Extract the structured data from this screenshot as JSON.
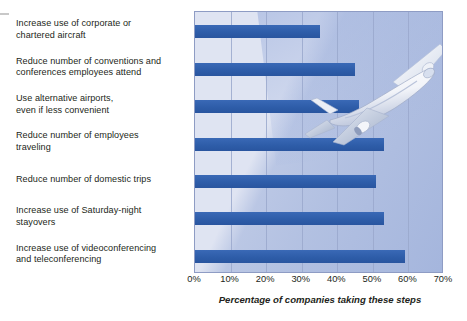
{
  "chart_data": {
    "type": "bar",
    "orientation": "horizontal",
    "title": "",
    "xlabel": "Percentage of companies taking these steps",
    "ylabel": "",
    "xlim": [
      0,
      70
    ],
    "xticks": [
      "0%",
      "10%",
      "20%",
      "30%",
      "40%",
      "50%",
      "60%",
      "70%"
    ],
    "xtick_values": [
      0,
      10,
      20,
      30,
      40,
      50,
      60,
      70
    ],
    "grid": true,
    "legend": false,
    "categories": [
      "Increase use of corporate or chartered aircraft",
      "Reduce number of conventions and conferences employees attend",
      "Use alternative airports, even if less convenient",
      "Reduce number of employees traveling",
      "Reduce number of domestic trips",
      "Increase use of Saturday-night stayovers",
      "Increase use of videoconferencing and teleconferencing"
    ],
    "values": [
      35,
      45,
      46,
      53,
      51,
      53,
      59
    ],
    "bar_color": "#2f5fae",
    "plot_background": "#dfe4f2",
    "gridline_color": "#9aa8cc"
  },
  "categories_wrapped": [
    [
      "Increase use of corporate or",
      "chartered aircraft"
    ],
    [
      "Reduce number of conventions and",
      "conferences employees attend"
    ],
    [
      "Use alternative airports,",
      "even if less convenient"
    ],
    [
      "Reduce number of employees",
      "traveling"
    ],
    [
      "Reduce number of domestic trips"
    ],
    [
      "Increase use of Saturday-night",
      "stayovers"
    ],
    [
      "Increase use of videoconferencing",
      "and teleconferencing"
    ]
  ],
  "decorations": {
    "airplane": "airplane-illustration"
  }
}
